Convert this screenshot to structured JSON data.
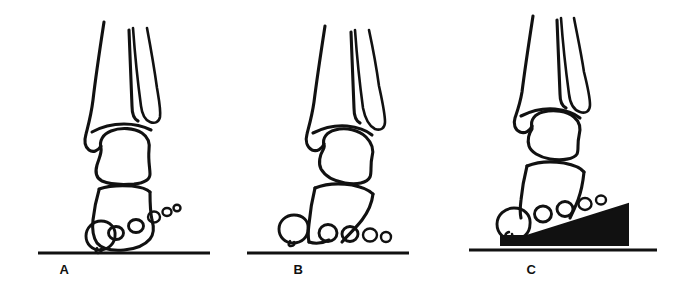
{
  "figure": {
    "kind": "anatomical-line-drawing",
    "background_color": "#ffffff",
    "ink_color": "#111111",
    "panel_count": 3
  },
  "panels": [
    {
      "id": "a",
      "label": "A",
      "caption_text": "A",
      "condition": "clawed toes elevated off the ground",
      "ground_line": true,
      "wedge_present": false,
      "toe_count": 5,
      "toes_on_ground": 1
    },
    {
      "id": "b",
      "label": "B",
      "caption_text": "B",
      "condition": "toes resting flat on the ground",
      "ground_line": true,
      "wedge_present": false,
      "toe_count": 5,
      "toes_on_ground": 5
    },
    {
      "id": "c",
      "label": "C",
      "caption_text": "C",
      "condition": "toes supported on a solid wedge",
      "ground_line": true,
      "wedge_present": true,
      "wedge_color": "#111111",
      "toe_count": 5,
      "toes_on_ground": 0
    }
  ],
  "colors": {
    "ink": "#111111",
    "paper": "#ffffff",
    "wedge_fill": "#111111"
  }
}
